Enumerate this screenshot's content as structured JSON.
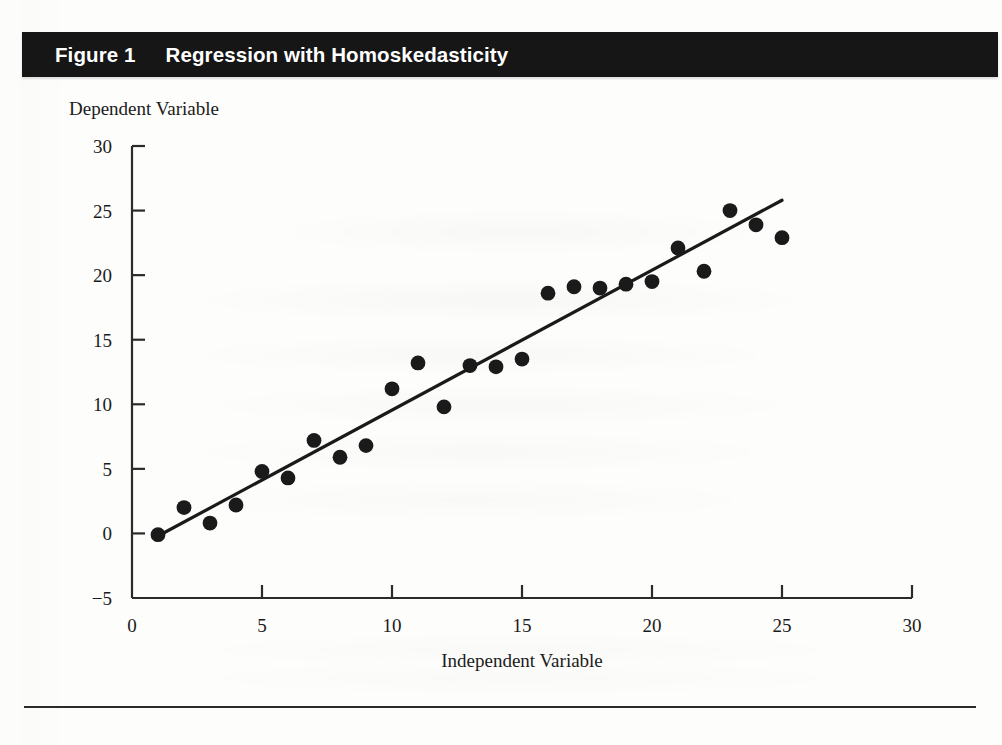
{
  "banner": {
    "figure_number": "Figure 1",
    "title": "Regression with Homoskedasticity",
    "background_color": "#161616",
    "text_color": "#ffffff"
  },
  "chart_data": {
    "type": "scatter",
    "title": "Regression with Homoskedasticity",
    "xlabel": "Independent Variable",
    "ylabel": "Dependent Variable",
    "xlim": [
      0,
      30
    ],
    "ylim": [
      -5,
      30
    ],
    "xticks": [
      0,
      5,
      10,
      15,
      20,
      25,
      30
    ],
    "yticks": [
      -5,
      0,
      5,
      10,
      15,
      20,
      25,
      30
    ],
    "xtick_labels": [
      "0",
      "5",
      "10",
      "15",
      "20",
      "25",
      "30"
    ],
    "ytick_labels": [
      "−5",
      "0",
      "5",
      "10",
      "15",
      "20",
      "25",
      "30"
    ],
    "grid": false,
    "legend": null,
    "marker_color": "#1a1a1a",
    "line_color": "#1a1a1a",
    "series": [
      {
        "name": "Observations",
        "type": "scatter",
        "x": [
          1,
          2,
          3,
          4,
          5,
          6,
          7,
          8,
          9,
          10,
          11,
          12,
          13,
          14,
          15,
          16,
          17,
          18,
          19,
          20,
          21,
          22,
          23,
          24,
          25
        ],
        "y": [
          -0.1,
          2.0,
          0.8,
          2.2,
          4.8,
          4.3,
          7.2,
          5.9,
          6.8,
          11.2,
          13.2,
          9.8,
          13.0,
          12.9,
          13.5,
          18.6,
          19.1,
          19.0,
          19.3,
          19.5,
          22.1,
          20.3,
          25.0,
          23.9,
          22.9
        ]
      },
      {
        "name": "Fitted regression line",
        "type": "line",
        "x": [
          1,
          25
        ],
        "y": [
          -0.2,
          25.8
        ]
      }
    ]
  },
  "footer": {
    "rule": true
  }
}
